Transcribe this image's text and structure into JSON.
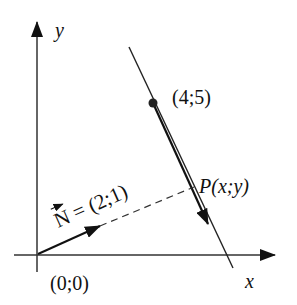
{
  "diagram": {
    "axes": {
      "x_label": "x",
      "y_label": "y"
    },
    "origin_label": "(0;0)",
    "point_label": "(4;5)",
    "p_label": "P(x;y)",
    "normal": {
      "symbol": "N",
      "equals": "= (2;1)"
    },
    "colors": {
      "ink": "#111111",
      "background": "#ffffff"
    }
  }
}
